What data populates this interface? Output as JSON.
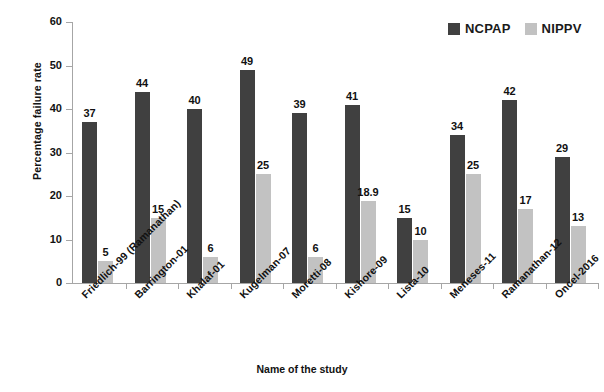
{
  "chart_data": {
    "type": "bar",
    "title": "",
    "xlabel": "Name of the study",
    "ylabel": "Percentage failure rate",
    "ylim": [
      0,
      60
    ],
    "yticks": [
      0,
      10,
      20,
      30,
      40,
      50,
      60
    ],
    "grid": false,
    "legend_position": "top-right",
    "categories": [
      "Friedlich-99 (Ramanathan)",
      "Barrington-01",
      "Khalaf-01",
      "Kugelman-07",
      "Moretti-08",
      "Kishore-09",
      "Lista-10",
      "Meneses-11",
      "Ramanathan-12",
      "Oncel-2016"
    ],
    "series": [
      {
        "name": "NCPAP",
        "color": "#404040",
        "values": [
          37,
          44,
          40,
          49,
          39,
          41,
          15,
          34,
          42,
          29
        ],
        "labels": [
          "37",
          "44",
          "40",
          "49",
          "39",
          "41",
          "15",
          "34",
          "42",
          "29"
        ]
      },
      {
        "name": "NIPPV",
        "color": "#c2c2c2",
        "values": [
          5,
          15,
          6,
          25,
          6,
          18.9,
          10,
          25,
          17,
          13
        ],
        "labels": [
          "5",
          "15",
          "6",
          "25",
          "6",
          "18.9",
          "10",
          "25",
          "17",
          "13"
        ]
      }
    ]
  },
  "axis": {
    "y_title": "Percentage failure rate",
    "x_title": "Name of the study",
    "tick_labels": [
      "0",
      "10",
      "20",
      "30",
      "40",
      "50",
      "60"
    ]
  },
  "legend": {
    "items": [
      {
        "label": "NCPAP",
        "color": "#404040"
      },
      {
        "label": "NIPPV",
        "color": "#c2c2c2"
      }
    ]
  }
}
